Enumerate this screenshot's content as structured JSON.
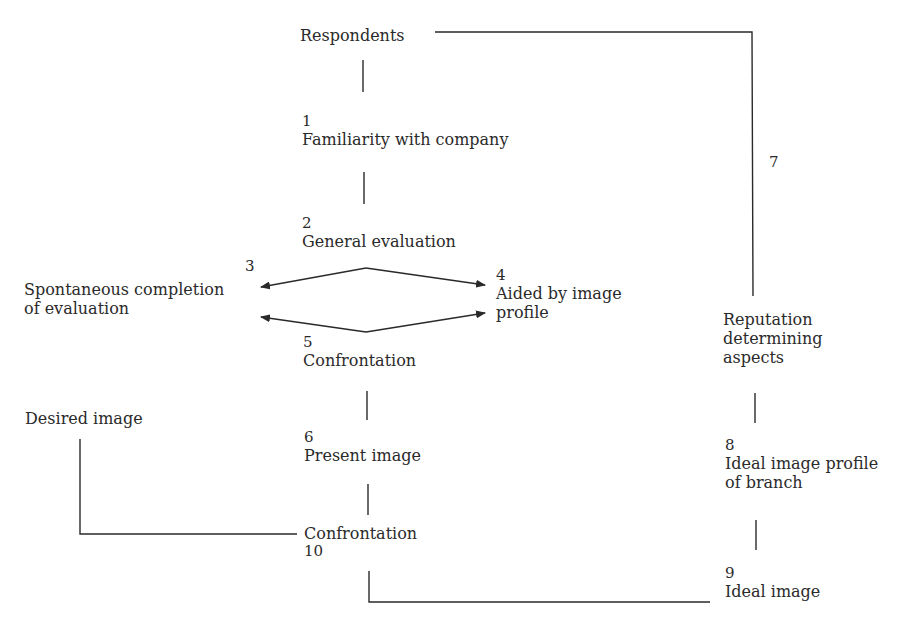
{
  "diagram": {
    "nodes": {
      "respondents": {
        "label": "Respondents"
      },
      "n1": {
        "number": "1",
        "label": "Familiarity with company"
      },
      "n2": {
        "number": "2",
        "label": "General evaluation"
      },
      "n3": {
        "number": "3",
        "line1": "Spontaneous completion",
        "line2": "of evaluation"
      },
      "n4": {
        "number": "4",
        "line1": "Aided by image",
        "line2": "profile"
      },
      "n5": {
        "number": "5",
        "label": "Confrontation"
      },
      "n6": {
        "number": "6",
        "label": "Present image"
      },
      "n7": {
        "number": "7"
      },
      "reputation": {
        "line1": "Reputation",
        "line2": "determining",
        "line3": "aspects"
      },
      "n8": {
        "number": "8",
        "line1": "Ideal image profile",
        "line2": "of branch"
      },
      "n9": {
        "number": "9",
        "label": "Ideal image"
      },
      "n10": {
        "number": "10",
        "label": "Confrontation"
      },
      "desired": {
        "label": "Desired image"
      }
    },
    "edges": [
      {
        "from": "respondents",
        "to": "n1",
        "type": "line"
      },
      {
        "from": "n1",
        "to": "n2",
        "type": "line"
      },
      {
        "from": "n2",
        "to": "n3",
        "type": "arrow"
      },
      {
        "from": "n2",
        "to": "n4",
        "type": "arrow"
      },
      {
        "from": "n5",
        "to": "n3",
        "type": "arrow"
      },
      {
        "from": "n5",
        "to": "n4",
        "type": "arrow"
      },
      {
        "from": "n5",
        "to": "n6",
        "type": "line"
      },
      {
        "from": "n6",
        "to": "n10",
        "type": "line"
      },
      {
        "from": "respondents",
        "to": "reputation",
        "type": "line",
        "label": "7"
      },
      {
        "from": "reputation",
        "to": "n8",
        "type": "line"
      },
      {
        "from": "n8",
        "to": "n9",
        "type": "line"
      },
      {
        "from": "desired",
        "to": "n10",
        "type": "line"
      },
      {
        "from": "n10",
        "to": "n9",
        "type": "line"
      }
    ],
    "colors": {
      "ink": "#2a2a2a",
      "background": "#ffffff"
    }
  }
}
